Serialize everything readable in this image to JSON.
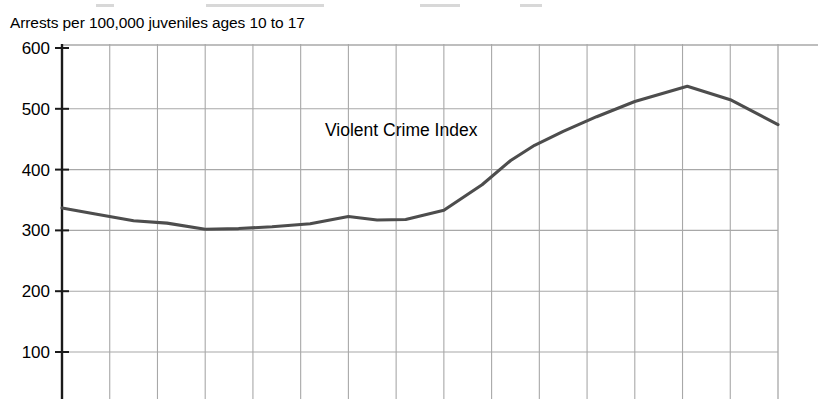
{
  "subtitle": "Arrests per 100,000 juveniles ages 10 to 17",
  "colors": {
    "line": "#4d4d4d",
    "axis": "#1a1a1a",
    "grid": "#a8a8a8",
    "text": "#000000",
    "background": "#ffffff"
  },
  "chart_data": {
    "type": "line",
    "title": "",
    "subtitle": "Arrests per 100,000 juveniles ages 10 to 17",
    "xlabel": "",
    "ylabel": "Arrests per 100,000 juveniles ages 10 to 17",
    "ylim": [
      0,
      600
    ],
    "yticks": [
      100,
      200,
      300,
      400,
      500,
      600
    ],
    "ytick_labels": [
      "100",
      "200",
      "300",
      "400",
      "500",
      "600"
    ],
    "xlim": [
      0,
      15
    ],
    "xticks": [
      0,
      1,
      2,
      3,
      4,
      5,
      6,
      7,
      8,
      9,
      10,
      11,
      12,
      13,
      14,
      15
    ],
    "xtick_labels": [
      "",
      "",
      "",
      "",
      "",
      "",
      "",
      "",
      "",
      "",
      "",
      "",
      "",
      "",
      "",
      ""
    ],
    "grid": true,
    "grid_axes": "both",
    "legend": "inline-annotation",
    "legend_position": "inside-upper-center",
    "annotations": [
      {
        "text": "Violent Crime Index",
        "x_index": 5.5,
        "y_value": 470
      }
    ],
    "series": [
      {
        "name": "Violent Crime Index",
        "values": [
          337,
          327,
          316,
          312,
          302,
          303,
          306,
          311,
          323,
          317,
          318,
          333,
          375,
          415,
          440,
          463,
          487,
          512,
          537,
          515,
          474
        ],
        "x": [
          0,
          0.7,
          1.5,
          2.2,
          3.0,
          3.7,
          4.4,
          5.2,
          6.0,
          6.6,
          7.2,
          8.0,
          8.8,
          9.4,
          9.9,
          10.5,
          11.2,
          12.0,
          13.1,
          14.0,
          15.0
        ]
      }
    ]
  },
  "note": "Chart is cropped: x-axis tick labels and chart title are not visible in the screenshot."
}
